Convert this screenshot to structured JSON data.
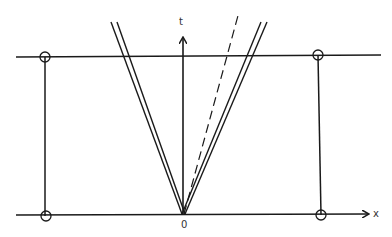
{
  "diagram": {
    "type": "spacetime-diagram",
    "labels": {
      "time_axis": "t",
      "space_axis": "x",
      "origin": "0"
    },
    "elements": {
      "top_line": "horizontal world line at later time",
      "bottom_line": "x axis",
      "left_worldline": "vertical line with circled endpoints",
      "right_worldline": "vertical line with circled endpoints",
      "light_cone": "double lines forming V from origin",
      "dashed_line": "dashed line from origin tilted right"
    },
    "colors": {
      "stroke": "#1a1a1a",
      "background": "#ffffff"
    }
  }
}
